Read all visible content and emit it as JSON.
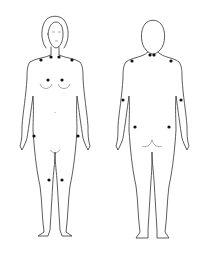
{
  "diagram": {
    "views": [
      {
        "name": "front-view",
        "label": ""
      },
      {
        "name": "back-view",
        "label": ""
      }
    ],
    "points_color": "#111111",
    "front_points": [
      {
        "id": "neck-left-lateral",
        "x": 41,
        "y": 60
      },
      {
        "id": "neck-left-medial",
        "x": 51,
        "y": 57
      },
      {
        "id": "neck-right-medial",
        "x": 59,
        "y": 57
      },
      {
        "id": "neck-right-lateral",
        "x": 72,
        "y": 60
      },
      {
        "id": "chest-left",
        "x": 48,
        "y": 80
      },
      {
        "id": "chest-right",
        "x": 62,
        "y": 80
      },
      {
        "id": "hip-left",
        "x": 34,
        "y": 136
      },
      {
        "id": "hip-right",
        "x": 78,
        "y": 136
      },
      {
        "id": "knee-left",
        "x": 49,
        "y": 180
      },
      {
        "id": "knee-right",
        "x": 62,
        "y": 180
      }
    ],
    "back_points": [
      {
        "id": "occiput-left",
        "x": 150,
        "y": 55
      },
      {
        "id": "occiput-right",
        "x": 154,
        "y": 55
      },
      {
        "id": "trapezius-left",
        "x": 132,
        "y": 61
      },
      {
        "id": "trapezius-right",
        "x": 171,
        "y": 61
      },
      {
        "id": "elbow-left",
        "x": 123,
        "y": 100
      },
      {
        "id": "elbow-right",
        "x": 181,
        "y": 100
      },
      {
        "id": "gluteal-left",
        "x": 135,
        "y": 127
      },
      {
        "id": "gluteal-right",
        "x": 169,
        "y": 127
      }
    ]
  }
}
